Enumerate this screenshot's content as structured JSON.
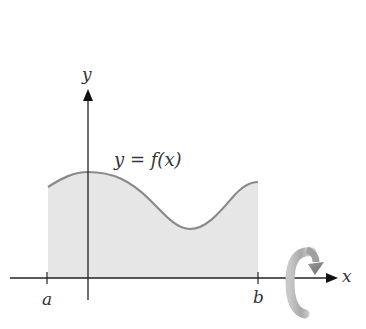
{
  "diagram": {
    "type": "solid-of-revolution",
    "y_axis_label": "y",
    "x_axis_label": "x",
    "curve_label": "y = f(x)",
    "left_bound_label": "a",
    "right_bound_label": "b",
    "rotation_indicator": "rotation-arrow-about-x-axis",
    "colors": {
      "curve": "#8a8a8a",
      "fill": "#e6e6e6",
      "axes": "#222222",
      "rotation_arrow": "#9a9a9a"
    }
  }
}
